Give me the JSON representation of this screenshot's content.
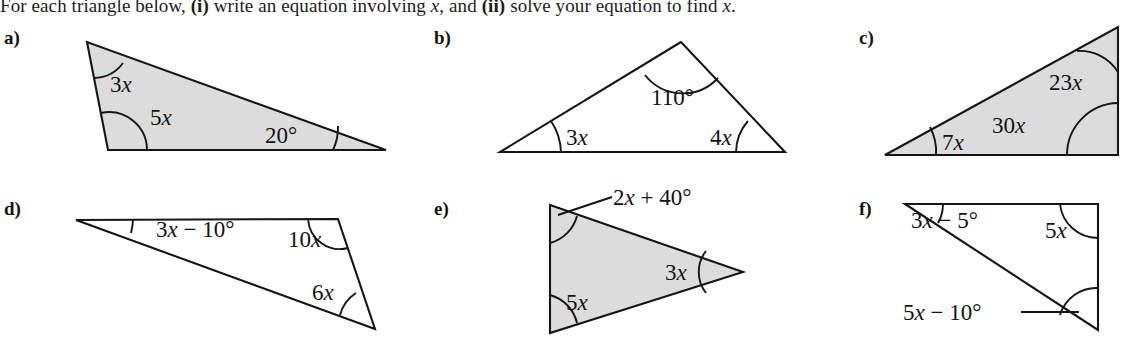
{
  "instruction": {
    "part1": "For each triangle below, ",
    "marker_i": "(i)",
    "part2": " write an equation involving ",
    "var1": "x",
    "part3": ", and ",
    "marker_ii": "(ii)",
    "part4": " solve your equation to find ",
    "var2": "x",
    "part5": "."
  },
  "style": {
    "fill_gray": "#dcdcdc",
    "stroke": "#151515",
    "page_background": "#ffffff"
  },
  "problems": [
    {
      "id": "a",
      "label": "a)",
      "shaded": true,
      "angles": [
        {
          "name": "top-angle",
          "text": "3x",
          "coef": "3",
          "variable": "x"
        },
        {
          "name": "bottom-left-angle",
          "text": "5x",
          "coef": "5",
          "variable": "x"
        },
        {
          "name": "bottom-right-angle",
          "text": "20°",
          "coef": "20",
          "variable": ""
        }
      ]
    },
    {
      "id": "b",
      "label": "b)",
      "shaded": false,
      "angles": [
        {
          "name": "apex-angle",
          "text": "110°",
          "coef": "110",
          "variable": ""
        },
        {
          "name": "bottom-left-angle",
          "text": "3x",
          "coef": "3",
          "variable": "x"
        },
        {
          "name": "bottom-right-angle",
          "text": "4x",
          "coef": "4",
          "variable": "x"
        }
      ]
    },
    {
      "id": "c",
      "label": "c)",
      "shaded": true,
      "angles": [
        {
          "name": "top-right-angle",
          "text": "23x",
          "coef": "23",
          "variable": "x"
        },
        {
          "name": "bottom-right-angle",
          "text": "30x",
          "coef": "30",
          "variable": "x"
        },
        {
          "name": "left-angle",
          "text": "7x",
          "coef": "7",
          "variable": "x"
        }
      ]
    },
    {
      "id": "d",
      "label": "d)",
      "shaded": false,
      "angles": [
        {
          "name": "left-angle",
          "text": "3x − 10°",
          "coef": "3",
          "variable": "x"
        },
        {
          "name": "top-right-angle",
          "text": "10x",
          "coef": "10",
          "variable": "x"
        },
        {
          "name": "bottom-right-angle",
          "text": "6x",
          "coef": "6",
          "variable": "x"
        }
      ]
    },
    {
      "id": "e",
      "label": "e)",
      "shaded": true,
      "angles": [
        {
          "name": "top-left-angle",
          "text": "2x + 40°",
          "coef": "2",
          "variable": "x"
        },
        {
          "name": "right-angle",
          "text": "3x",
          "coef": "3",
          "variable": "x"
        },
        {
          "name": "bottom-left-angle",
          "text": "5x",
          "coef": "5",
          "variable": "x"
        }
      ]
    },
    {
      "id": "f",
      "label": "f)",
      "shaded": false,
      "angles": [
        {
          "name": "top-left-angle",
          "text": "3x − 5°",
          "coef": "3",
          "variable": "x"
        },
        {
          "name": "top-right-angle",
          "text": "5x",
          "coef": "5",
          "variable": "x"
        },
        {
          "name": "bottom-right-angle",
          "text": "5x − 10°",
          "coef": "5",
          "variable": "x"
        }
      ]
    }
  ]
}
